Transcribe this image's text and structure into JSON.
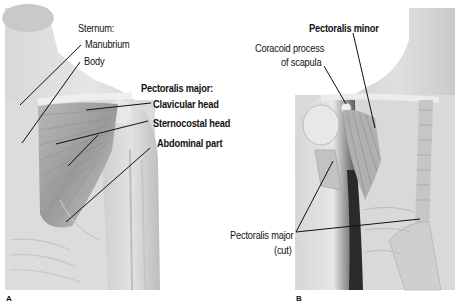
{
  "figure": {
    "panel_a": {
      "id_label": "A",
      "labels": {
        "sternum_heading": "Sternum:",
        "manubrium": "Manubrium",
        "body": "Body",
        "pec_major_heading": "Pectoralis major:",
        "clavicular_head": "Clavicular head",
        "sternocostal_head": "Sternocostal head",
        "abdominal_part": "Abdominal part"
      }
    },
    "panel_b": {
      "id_label": "B",
      "labels": {
        "pec_minor": "Pectoralis minor",
        "coracoid_line1": "Coracoid process",
        "coracoid_line2": "of scapula",
        "pec_major_cut_line1": "Pectoralis major",
        "pec_major_cut_line2": "(cut)"
      }
    }
  }
}
